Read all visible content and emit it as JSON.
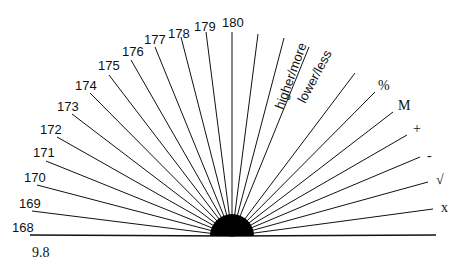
{
  "diagram": {
    "center": {
      "x": 232,
      "y": 236,
      "radius": 22
    },
    "bottom_label": "9.8",
    "rays": [
      {
        "label": "168",
        "end": [
          30,
          235
        ],
        "lx": 12,
        "ly": 232,
        "style": "lbl"
      },
      {
        "label": "169",
        "end": [
          32,
          211
        ],
        "lx": 19,
        "ly": 208,
        "style": "lbl"
      },
      {
        "label": "170",
        "end": [
          37,
          185
        ],
        "lx": 24,
        "ly": 182,
        "style": "lbl"
      },
      {
        "label": "171",
        "end": [
          46,
          161
        ],
        "lx": 33,
        "ly": 157,
        "style": "lbl"
      },
      {
        "label": "172",
        "end": [
          57,
          137
        ],
        "lx": 40,
        "ly": 134,
        "style": "lbl"
      },
      {
        "label": "173",
        "end": [
          72,
          114
        ],
        "lx": 57,
        "ly": 111,
        "style": "lbl"
      },
      {
        "label": "174",
        "end": [
          90,
          93
        ],
        "lx": 75,
        "ly": 90,
        "style": "lbl"
      },
      {
        "label": "175",
        "end": [
          109,
          75
        ],
        "lx": 98,
        "ly": 70,
        "style": "lbl"
      },
      {
        "label": "176",
        "end": [
          131,
          60
        ],
        "lx": 122,
        "ly": 56,
        "style": "lbl"
      },
      {
        "label": "177",
        "end": [
          155,
          47
        ],
        "lx": 144,
        "ly": 44,
        "style": "lbl"
      },
      {
        "label": "178",
        "end": [
          181,
          37
        ],
        "lx": 168,
        "ly": 38,
        "style": "lbl"
      },
      {
        "label": "179",
        "end": [
          206,
          32
        ],
        "lx": 194,
        "ly": 31,
        "style": "lbl"
      },
      {
        "label": "180",
        "end": [
          232,
          32
        ],
        "lx": 222,
        "ly": 27,
        "style": "lbl"
      },
      {
        "label": "",
        "end": [
          258,
          34
        ]
      },
      {
        "label": "higher/more",
        "end": [
          284,
          38
        ],
        "rotated": true,
        "lx": 283,
        "ly": 110,
        "angle": -70
      },
      {
        "label": "lower/less",
        "end": [
          309,
          47
        ],
        "rotated": true,
        "lx": 305,
        "ly": 104,
        "angle": -62
      },
      {
        "label": "",
        "end": [
          355,
          73
        ]
      },
      {
        "label": "%",
        "end": [
          375,
          92
        ],
        "lx": 378,
        "ly": 90,
        "style": "serif"
      },
      {
        "label": "M",
        "end": [
          393,
          112
        ],
        "lx": 398,
        "ly": 110,
        "style": "serif"
      },
      {
        "label": "+",
        "end": [
          407,
          135
        ],
        "lx": 413,
        "ly": 133,
        "style": "serif"
      },
      {
        "label": "-",
        "end": [
          420,
          157
        ],
        "lx": 427,
        "ly": 160,
        "style": "serif"
      },
      {
        "label": "√",
        "end": [
          428,
          182
        ],
        "lx": 436,
        "ly": 184,
        "style": "serif"
      },
      {
        "label": "x",
        "end": [
          433,
          209
        ],
        "lx": 441,
        "ly": 212,
        "style": "serif"
      },
      {
        "label": "",
        "end": [
          436,
          235
        ]
      }
    ]
  }
}
